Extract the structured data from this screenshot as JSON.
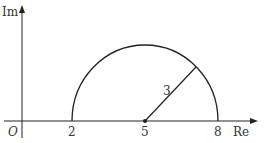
{
  "diagram": {
    "type": "complex-plane-semicircle",
    "axes": {
      "x_label": "Re",
      "y_label": "Im",
      "origin_label": "O"
    },
    "circle": {
      "center": 5,
      "radius": 3,
      "radius_label": "3",
      "portion": "upper-half"
    },
    "ticks": [
      {
        "value": 2,
        "label": "2"
      },
      {
        "value": 5,
        "label": "5"
      },
      {
        "value": 8,
        "label": "8"
      }
    ],
    "colors": {
      "stroke": "#222222",
      "text": "#333333"
    }
  }
}
